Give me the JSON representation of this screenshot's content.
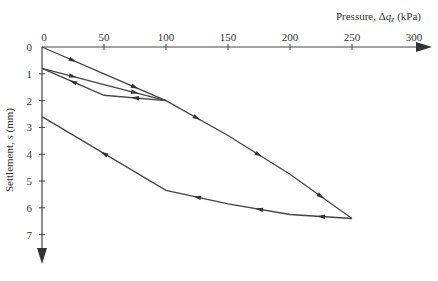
{
  "chart_data": {
    "type": "line",
    "title": "",
    "xlabel": "Pressure, Δq_z (kPa)",
    "ylabel": "Settlement, s (mm)",
    "x_ticks": [
      0,
      50,
      100,
      150,
      200,
      250,
      300
    ],
    "y_ticks": [
      0,
      1,
      2,
      3,
      4,
      5,
      6,
      7
    ],
    "xlim": [
      0,
      300
    ],
    "ylim": [
      0,
      7.7
    ],
    "y_inverted": true,
    "x_axis_position": "top",
    "grid": false,
    "legend": null,
    "series": [
      {
        "name": "Initial loading",
        "points": [
          [
            0,
            0
          ],
          [
            50,
            1.0
          ],
          [
            100,
            2.0
          ]
        ]
      },
      {
        "name": "Unloading 1",
        "points": [
          [
            100,
            2.0
          ],
          [
            50,
            1.8
          ],
          [
            0,
            0.8
          ]
        ]
      },
      {
        "name": "Reloading 1",
        "points": [
          [
            0,
            0.8
          ],
          [
            50,
            1.4
          ],
          [
            100,
            2.0
          ]
        ]
      },
      {
        "name": "Loading continued",
        "points": [
          [
            100,
            2.0
          ],
          [
            150,
            3.3
          ],
          [
            200,
            4.75
          ],
          [
            250,
            6.4
          ]
        ]
      },
      {
        "name": "Unloading 2",
        "points": [
          [
            250,
            6.4
          ],
          [
            200,
            6.25
          ],
          [
            150,
            5.85
          ],
          [
            100,
            5.35
          ],
          [
            0,
            2.6
          ]
        ]
      }
    ]
  },
  "labels": {
    "x_title_main": "Pressure, Δ",
    "x_title_var": "q",
    "x_title_sub": "z",
    "x_title_unit": " (kPa)",
    "y_title_main": "Settlement, ",
    "y_title_var": "s",
    "y_title_unit": " (mm)"
  }
}
